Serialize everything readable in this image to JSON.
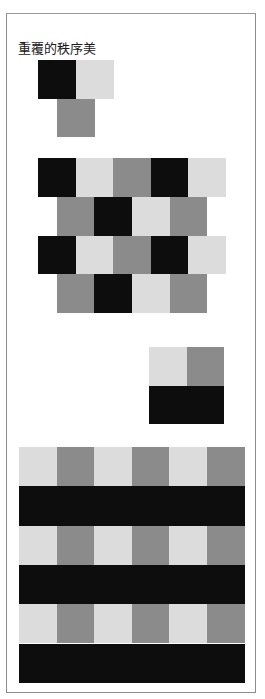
{
  "title": "重覆的秩序美",
  "colors": {
    "black": "#0d0d0d",
    "gray": "#8b8b8b",
    "light": "#dcdcdc",
    "border": "#8c8c8c"
  },
  "figures": [
    {
      "name": "motif-unit",
      "description": "Base unit: black and light squares side by side, gray square centered below",
      "cells": [
        {
          "row": 0,
          "col": 0,
          "color": "black"
        },
        {
          "row": 0,
          "col": 1,
          "color": "light"
        },
        {
          "row": 1,
          "col": 0.5,
          "color": "gray"
        }
      ]
    },
    {
      "name": "brick-repeat-pattern",
      "description": "Repeated motif in staggered rows",
      "rows": [
        {
          "offset": 0,
          "cells": [
            "black",
            "light",
            "gray",
            "black",
            "light"
          ]
        },
        {
          "offset": 0.5,
          "cells": [
            "gray",
            "black",
            "light",
            "gray"
          ]
        },
        {
          "offset": 0,
          "cells": [
            "black",
            "light",
            "gray",
            "black",
            "light"
          ]
        },
        {
          "offset": 0.5,
          "cells": [
            "gray",
            "black",
            "light",
            "gray"
          ]
        }
      ]
    },
    {
      "name": "checker-unit",
      "description": "2x2 unit: light/gray over black/black",
      "rows": [
        [
          "light",
          "gray"
        ],
        [
          "black",
          "black"
        ]
      ]
    },
    {
      "name": "plaid-repeat-pattern",
      "description": "6x6 grid repeating the 2x2 unit",
      "rows": [
        [
          "light",
          "gray",
          "light",
          "gray",
          "light",
          "gray"
        ],
        [
          "black",
          "black",
          "black",
          "black",
          "black",
          "black"
        ],
        [
          "light",
          "gray",
          "light",
          "gray",
          "light",
          "gray"
        ],
        [
          "black",
          "black",
          "black",
          "black",
          "black",
          "black"
        ],
        [
          "light",
          "gray",
          "light",
          "gray",
          "light",
          "gray"
        ],
        [
          "black",
          "black",
          "black",
          "black",
          "black",
          "black"
        ]
      ]
    }
  ]
}
